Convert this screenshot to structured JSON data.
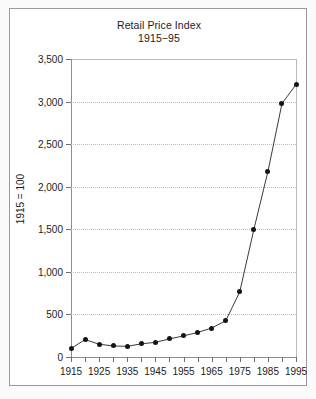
{
  "chart_data": {
    "type": "line",
    "title": "Retail Price Index",
    "subtitle": "1915−95",
    "xlabel": "",
    "ylabel": "1915 = 100",
    "grid": true,
    "legend": "none",
    "xlim": [
      1915,
      1995
    ],
    "ylim": [
      0,
      3500
    ],
    "y_ticks": [
      0,
      500,
      1000,
      1500,
      2000,
      2500,
      3000,
      3500
    ],
    "y_tick_labels": [
      "0",
      "500",
      "1,000",
      "1,500",
      "2,000",
      "2,500",
      "3,000",
      "3,500"
    ],
    "x_ticks": [
      1915,
      1920,
      1925,
      1930,
      1935,
      1940,
      1945,
      1950,
      1955,
      1960,
      1965,
      1970,
      1975,
      1980,
      1985,
      1990,
      1995
    ],
    "x_tick_labels": [
      "1915",
      "",
      "1925",
      "",
      "1935",
      "",
      "1945",
      "",
      "1955",
      "",
      "1965",
      "",
      "1975",
      "",
      "1985",
      "",
      "1995"
    ],
    "x": [
      1915,
      1920,
      1925,
      1930,
      1935,
      1940,
      1945,
      1950,
      1955,
      1960,
      1965,
      1970,
      1975,
      1980,
      1985,
      1990,
      1995
    ],
    "values": [
      100,
      205,
      150,
      130,
      125,
      155,
      172,
      212,
      248,
      288,
      340,
      425,
      765,
      1495,
      2175,
      2975,
      3200
    ],
    "series": [
      {
        "name": "Retail Price Index",
        "values": [
          100,
          205,
          150,
          130,
          125,
          155,
          172,
          212,
          248,
          288,
          340,
          425,
          765,
          1495,
          2175,
          2975,
          3200
        ]
      }
    ],
    "line_color": "#3a3a3a",
    "marker_color": "#141414",
    "grid_color": "#bdbdbd",
    "axis_color": "#8e8e8e"
  }
}
